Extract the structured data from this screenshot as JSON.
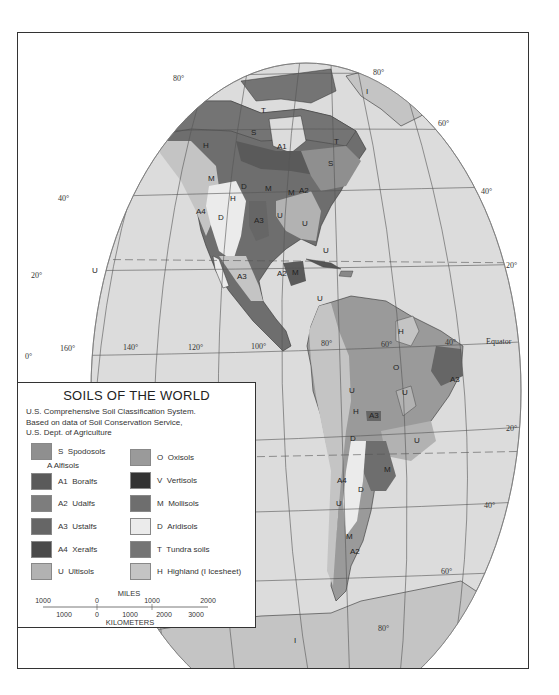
{
  "legend": {
    "title": "SOILS OF THE WORLD",
    "subtitle_lines": [
      "U.S. Comprehensive Soil Classification System.",
      "Based on data of Soil Conservation Service,",
      "U.S. Dept. of Agriculture"
    ],
    "group_heading": "A  Alfisols",
    "left_items": [
      {
        "code": "S",
        "name": "Spodosols",
        "color": "#8f8f8f"
      },
      {
        "code": "A1",
        "name": "Boralfs",
        "color": "#5a5a5a"
      },
      {
        "code": "A2",
        "name": "Udalfs",
        "color": "#7d7d7d"
      },
      {
        "code": "A3",
        "name": "Ustalfs",
        "color": "#666666"
      },
      {
        "code": "A4",
        "name": "Xeralfs",
        "color": "#4a4a4a"
      },
      {
        "code": "U",
        "name": "Ultisols",
        "color": "#b2b2b2"
      }
    ],
    "right_items": [
      {
        "code": "O",
        "name": "Oxisols",
        "color": "#9a9a9a"
      },
      {
        "code": "V",
        "name": "Vertisols",
        "color": "#333333"
      },
      {
        "code": "M",
        "name": "Mollisols",
        "color": "#6e6e6e"
      },
      {
        "code": "D",
        "name": "Aridisols",
        "color": "#ebebeb"
      },
      {
        "code": "T",
        "name": "Tundra soils",
        "color": "#747474"
      },
      {
        "code": "H",
        "name": "Highland (I  Icesheet)",
        "color": "#c4c4c4"
      }
    ],
    "scale": {
      "miles_label": "MILES",
      "miles_ticks": [
        "1000",
        "0",
        "1000",
        "2000"
      ],
      "km_label": "KILOMETERS",
      "km_ticks": [
        "1000",
        "0",
        "1000",
        "2000",
        "3000"
      ]
    }
  },
  "map": {
    "ocean_color": "#dcdcdc",
    "latitude_labels": [
      "80°",
      "80°",
      "60°",
      "40°",
      "40°",
      "20°",
      "20°",
      "0°",
      "20°",
      "40°",
      "60°",
      "80°"
    ],
    "longitude_labels": [
      "160°",
      "140°",
      "120°",
      "100°",
      "80°",
      "60°",
      "40°"
    ],
    "equator_label": "Equator",
    "region_labels": [
      "T",
      "T",
      "H",
      "S",
      "A1",
      "M",
      "M",
      "M",
      "A2",
      "D",
      "H",
      "D",
      "A4",
      "A3",
      "U",
      "U",
      "U",
      "S",
      "I",
      "A3",
      "M",
      "A2",
      "U",
      "H",
      "O",
      "U",
      "A3",
      "U",
      "H",
      "A3",
      "U",
      "D",
      "M",
      "A4",
      "D",
      "U",
      "M",
      "A2",
      "I",
      "U"
    ]
  }
}
